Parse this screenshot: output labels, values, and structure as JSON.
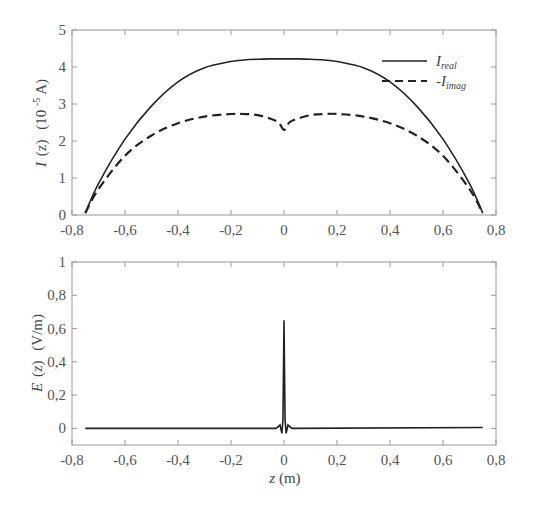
{
  "chart_data": [
    {
      "type": "line",
      "title": "",
      "xlabel": "",
      "ylabel": "I (z)  (10^-5 A)",
      "ylabel_parts": {
        "var": "I",
        "arg": "(z)",
        "unit_pre": "(10",
        "unit_exp": "-5",
        "unit_post": " A)"
      },
      "xlim": [
        -0.8,
        0.8
      ],
      "ylim": [
        0,
        5
      ],
      "xticks": [
        "-0,8",
        "-0,6",
        "-0,4",
        "-0,2",
        "0",
        "0,2",
        "0,4",
        "0,6",
        "0,8"
      ],
      "yticks": [
        "0",
        "1",
        "2",
        "3",
        "4",
        "5"
      ],
      "grid": false,
      "legend_position": "upper right",
      "x": [
        -0.75,
        -0.7,
        -0.6,
        -0.5,
        -0.4,
        -0.3,
        -0.2,
        -0.15,
        -0.1,
        -0.05,
        -0.02,
        0,
        0.02,
        0.05,
        0.1,
        0.15,
        0.2,
        0.3,
        0.4,
        0.5,
        0.6,
        0.7,
        0.75
      ],
      "series": [
        {
          "name": "I_real",
          "legend_main": "I",
          "legend_sub": "real",
          "style": "solid",
          "values": [
            0.05,
            0.85,
            2.05,
            2.95,
            3.6,
            3.98,
            4.15,
            4.19,
            4.21,
            4.22,
            4.22,
            4.22,
            4.22,
            4.22,
            4.21,
            4.19,
            4.15,
            3.98,
            3.6,
            2.95,
            2.05,
            0.85,
            0.05
          ]
        },
        {
          "name": "-I_imag",
          "legend_main": "-I",
          "legend_sub": "imag",
          "style": "dashed",
          "values": [
            0.05,
            0.7,
            1.6,
            2.15,
            2.48,
            2.66,
            2.73,
            2.73,
            2.7,
            2.6,
            2.5,
            2.3,
            2.5,
            2.6,
            2.7,
            2.73,
            2.73,
            2.66,
            2.48,
            2.15,
            1.6,
            0.7,
            0.05
          ]
        }
      ]
    },
    {
      "type": "line",
      "title": "",
      "xlabel": "z (m)",
      "xlabel_parts": {
        "var": "z",
        "unit": " (m)"
      },
      "ylabel": "E (z)  (V/m)",
      "ylabel_parts": {
        "var": "E",
        "arg": "(z)",
        "unit": "  (V/m)"
      },
      "xlim": [
        -0.8,
        0.8
      ],
      "ylim": [
        -0.1,
        1
      ],
      "xticks": [
        "-0,8",
        "-0,6",
        "-0,4",
        "-0,2",
        "0",
        "0,2",
        "0,4",
        "0,6",
        "0,8"
      ],
      "yticks": [
        "0",
        "0,2",
        "0,4",
        "0,6",
        "0,8",
        "1"
      ],
      "grid": false,
      "x": [
        -0.75,
        -0.03,
        -0.015,
        -0.008,
        -0.004,
        0,
        0.004,
        0.008,
        0.015,
        0.03,
        0.75
      ],
      "series": [
        {
          "name": "E",
          "style": "solid",
          "values": [
            0.0,
            0.0,
            0.02,
            -0.03,
            0.05,
            0.65,
            0.05,
            -0.03,
            0.02,
            0.0,
            0.005
          ]
        }
      ]
    }
  ]
}
